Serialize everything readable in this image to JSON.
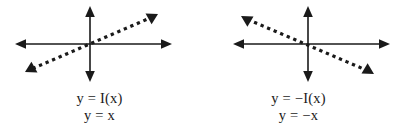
{
  "figure": {
    "background_color": "#ffffff",
    "stroke_color": "#1a1a1a",
    "text_color": "#1a1a1a"
  },
  "panels": [
    {
      "id": "identity-function",
      "caption_line1": "y = I(x)",
      "caption_line2": "y = x",
      "axes": {
        "origin": [
          90,
          44
        ],
        "x_axis": {
          "from": [
            15,
            44
          ],
          "to": [
            172,
            44
          ],
          "arrows": "both"
        },
        "y_axis": {
          "from": [
            90,
            6
          ],
          "to": [
            90,
            82
          ],
          "arrows": "both"
        }
      },
      "graph": {
        "style": "dotted",
        "slope": "positive",
        "from": [
          25,
          72
        ],
        "to": [
          158,
          14
        ],
        "arrows": "both",
        "dot_size": 3,
        "dot_spacing": 7
      }
    },
    {
      "id": "negative-identity-function",
      "caption_line1": "y = −I(x)",
      "caption_line2": "y = −x",
      "axes": {
        "origin": [
          109,
          44
        ],
        "x_axis": {
          "from": [
            34,
            44
          ],
          "to": [
            191,
            44
          ],
          "arrows": "both"
        },
        "y_axis": {
          "from": [
            109,
            6
          ],
          "to": [
            109,
            82
          ],
          "arrows": "both"
        }
      },
      "graph": {
        "style": "dotted",
        "slope": "negative",
        "from": [
          42,
          16
        ],
        "to": [
          175,
          74
        ],
        "arrows": "both",
        "dot_size": 3,
        "dot_spacing": 7
      }
    }
  ]
}
